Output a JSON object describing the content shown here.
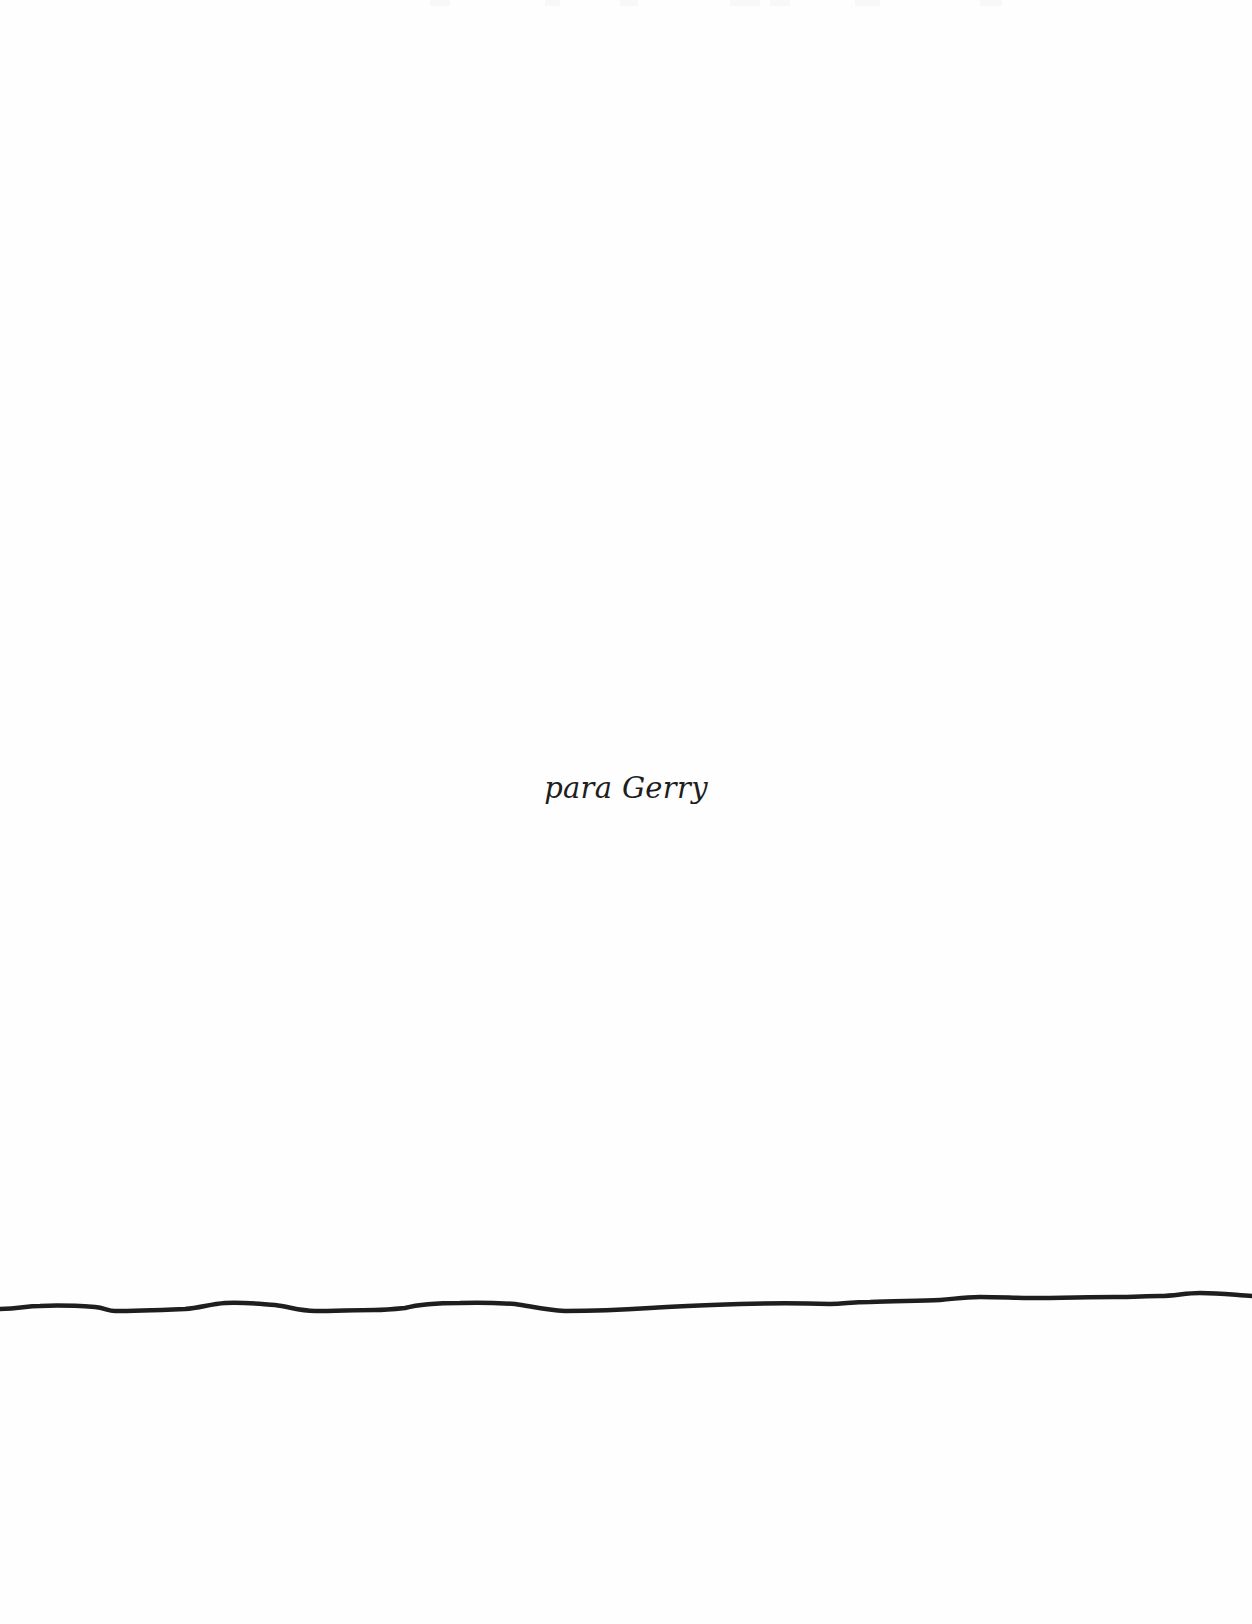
{
  "page": {
    "background_color": "#fefefe",
    "ink_color": "#1e1e1e"
  },
  "dedication": {
    "text": "para Gerry"
  },
  "divider": {
    "style": "hand-drawn wavy horizontal rule",
    "color": "#1e1e1e"
  }
}
